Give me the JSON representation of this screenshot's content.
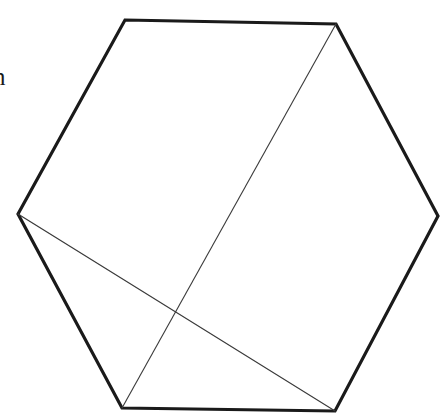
{
  "figure": {
    "canvas": {
      "width": 448,
      "height": 416,
      "background": "#ffffff"
    },
    "stroke_colors": {
      "outline": "#1a1a1a",
      "diagonal": "#3a3a3a"
    },
    "stroke_widths": {
      "outline": 3.2,
      "diagonal": 1.1
    },
    "polygon": {
      "name": "hexagon",
      "closed": true,
      "points": "125,20 336,24 438,216 335,411 122,408 18,214",
      "vertices": [
        {
          "label": "top-left",
          "x": 125,
          "y": 20
        },
        {
          "label": "top-right",
          "x": 336,
          "y": 24
        },
        {
          "label": "right",
          "x": 438,
          "y": 216
        },
        {
          "label": "bottom-right",
          "x": 335,
          "y": 411
        },
        {
          "label": "bottom-left",
          "x": 122,
          "y": 408
        },
        {
          "label": "left",
          "x": 18,
          "y": 214
        }
      ]
    },
    "diagonals": [
      {
        "label": "diagonal-top-right-to-bottom-left",
        "x1": 336,
        "y1": 24,
        "x2": 122,
        "y2": 408
      },
      {
        "label": "diagonal-left-to-bottom-right",
        "x1": 18,
        "y1": 214,
        "x2": 335,
        "y2": 411
      }
    ],
    "intersection": {
      "label": "diagonal-crossing-point",
      "x": 175,
      "y": 312
    },
    "margin_text": {
      "text": "n",
      "x": -7,
      "y": 64
    }
  }
}
